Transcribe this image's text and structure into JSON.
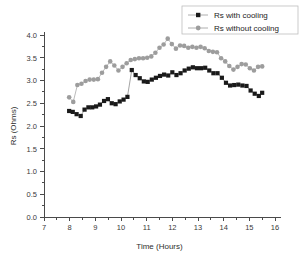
{
  "chart_data": {
    "type": "scatter",
    "title": "",
    "xlabel": "Time (Hours)",
    "ylabel": "Rs (Ohms)",
    "xlim": [
      7,
      16
    ],
    "ylim": [
      0.0,
      4.0
    ],
    "xticks": [
      7,
      8,
      9,
      10,
      11,
      12,
      13,
      14,
      15,
      16
    ],
    "xtick_labels": [
      "7",
      "8",
      "9",
      "10",
      "11",
      "12",
      "13",
      "14",
      "15",
      "16"
    ],
    "yticks": [
      0.0,
      0.5,
      1.0,
      1.5,
      2.0,
      2.5,
      3.0,
      3.5,
      4.0
    ],
    "ytick_labels": [
      "0.0",
      "0.5",
      "1.0",
      "1.5",
      "2.0",
      "2.5",
      "3.0",
      "3.5",
      "4.0"
    ],
    "x_minor_tick_step": 0.5,
    "y_minor_tick_step": 0.25,
    "grid": false,
    "legend_position": "top-right",
    "series": [
      {
        "name": "Rs with cooling",
        "marker": "square",
        "color": "#1a1a1a",
        "line_color": "#8d8d8d",
        "x": [
          7.98,
          8.12,
          8.27,
          8.43,
          8.58,
          8.73,
          8.88,
          9.03,
          9.18,
          9.34,
          9.49,
          9.64,
          9.79,
          9.95,
          10.1,
          10.25,
          10.42,
          10.57,
          10.73,
          10.89,
          11.04,
          11.2,
          11.36,
          11.52,
          11.68,
          11.84,
          12.0,
          12.16,
          12.32,
          12.48,
          12.64,
          12.8,
          12.96,
          13.12,
          13.28,
          13.44,
          13.6,
          13.76,
          13.93,
          14.09,
          14.25,
          14.41,
          14.57,
          14.73,
          14.89,
          15.05,
          15.21,
          15.37,
          15.5
        ],
        "y": [
          2.33,
          2.31,
          2.26,
          2.22,
          2.36,
          2.41,
          2.41,
          2.43,
          2.47,
          2.55,
          2.59,
          2.5,
          2.48,
          2.54,
          2.58,
          2.64,
          3.23,
          3.12,
          3.05,
          2.98,
          2.97,
          3.02,
          3.06,
          3.1,
          3.13,
          3.11,
          3.18,
          3.12,
          3.16,
          3.22,
          3.26,
          3.29,
          3.27,
          3.27,
          3.28,
          3.22,
          3.16,
          3.16,
          3.06,
          2.95,
          2.89,
          2.9,
          2.91,
          2.89,
          2.88,
          2.78,
          2.71,
          2.66,
          2.73
        ]
      },
      {
        "name": "Rs without cooling",
        "marker": "circle",
        "color": "#9d9d9d",
        "line_color": "#b3b3b3",
        "x": [
          7.98,
          8.14,
          8.3,
          8.46,
          8.62,
          8.78,
          8.94,
          9.1,
          9.26,
          9.42,
          9.58,
          9.74,
          9.9,
          10.06,
          10.22,
          10.38,
          10.54,
          10.7,
          10.86,
          11.02,
          11.18,
          11.34,
          11.5,
          11.66,
          11.82,
          11.98,
          12.14,
          12.3,
          12.46,
          12.62,
          12.78,
          12.94,
          13.1,
          13.26,
          13.42,
          13.58,
          13.74,
          13.9,
          14.06,
          14.22,
          14.38,
          14.54,
          14.7,
          14.86,
          15.02,
          15.18,
          15.34,
          15.5
        ],
        "y": [
          2.63,
          2.53,
          2.9,
          2.93,
          2.99,
          3.02,
          3.02,
          3.03,
          3.17,
          3.3,
          3.42,
          3.33,
          3.22,
          3.3,
          3.38,
          3.45,
          3.47,
          3.49,
          3.49,
          3.5,
          3.53,
          3.61,
          3.72,
          3.79,
          3.92,
          3.8,
          3.7,
          3.77,
          3.76,
          3.72,
          3.74,
          3.72,
          3.74,
          3.71,
          3.65,
          3.63,
          3.62,
          3.49,
          3.42,
          3.32,
          3.24,
          3.3,
          3.36,
          3.35,
          3.27,
          3.22,
          3.3,
          3.31
        ]
      }
    ]
  },
  "legend": {
    "entries": [
      {
        "label": "Rs with cooling"
      },
      {
        "label": "Rs without cooling"
      }
    ]
  }
}
